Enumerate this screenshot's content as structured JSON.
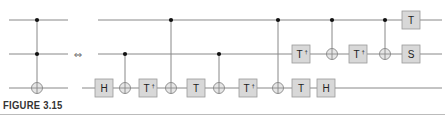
{
  "figure": {
    "caption": "FIGURE 3.15",
    "equivalence_symbol": "⇔"
  },
  "colors": {
    "wire": "#888888",
    "gate_fill": "#d8d8d8",
    "gate_stroke": "#999999",
    "control_dot": "#111111",
    "target": "#888888"
  },
  "wires_y": [
    20,
    54,
    88
  ],
  "left_circuit": {
    "name": "Toffoli gate",
    "wire_x": [
      9,
      68
    ],
    "gates": [
      {
        "type": "toffoli",
        "x": 37,
        "controls": [
          0,
          1
        ],
        "target": 2
      }
    ]
  },
  "right_circuit": {
    "wire_x_start": [
      98,
      98,
      82
    ],
    "wire_x_end": 442,
    "gates": [
      {
        "type": "single",
        "label": "H",
        "dagger": false,
        "wire": 2,
        "x": 104
      },
      {
        "type": "cnot",
        "control": 1,
        "target": 2,
        "x": 125
      },
      {
        "type": "single",
        "label": "T",
        "dagger": true,
        "wire": 2,
        "x": 148
      },
      {
        "type": "cnot",
        "control": 0,
        "target": 2,
        "x": 171
      },
      {
        "type": "single",
        "label": "T",
        "dagger": false,
        "wire": 2,
        "x": 196
      },
      {
        "type": "cnot",
        "control": 1,
        "target": 2,
        "x": 219
      },
      {
        "type": "single",
        "label": "T",
        "dagger": true,
        "wire": 2,
        "x": 248
      },
      {
        "type": "cnot",
        "control": 0,
        "target": 2,
        "x": 278
      },
      {
        "type": "single",
        "label": "T",
        "dagger": true,
        "wire": 1,
        "x": 301
      },
      {
        "type": "single",
        "label": "T",
        "dagger": false,
        "wire": 2,
        "x": 301
      },
      {
        "type": "single",
        "label": "H",
        "dagger": false,
        "wire": 2,
        "x": 326
      },
      {
        "type": "cnot",
        "control": 0,
        "target": 1,
        "x": 332
      },
      {
        "type": "single",
        "label": "T",
        "dagger": true,
        "wire": 1,
        "x": 358
      },
      {
        "type": "cnot",
        "control": 0,
        "target": 1,
        "x": 385
      },
      {
        "type": "single",
        "label": "T",
        "dagger": false,
        "wire": 0,
        "x": 411
      },
      {
        "type": "single",
        "label": "S",
        "dagger": false,
        "wire": 1,
        "x": 411
      }
    ]
  }
}
